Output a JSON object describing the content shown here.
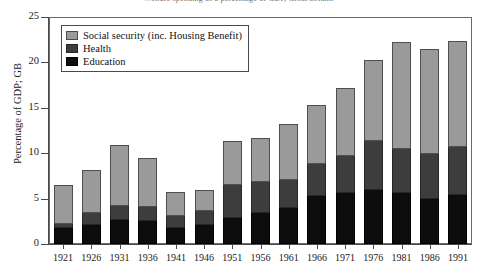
{
  "chart_data": {
    "type": "bar",
    "subtype": "stacked-vertical",
    "title": "Welfare spending as a percentage of GDP, Great Britain",
    "xlabel": "",
    "ylabel": "Percentage of GDP; GB",
    "ylim": [
      0,
      25
    ],
    "yticks": [
      0,
      5,
      10,
      15,
      20,
      25
    ],
    "ytick_labels": [
      "0",
      "5",
      "10",
      "15",
      "20",
      "25"
    ],
    "grid": false,
    "legend_position": "top-left",
    "categories": [
      "1921",
      "1926",
      "1931",
      "1936",
      "1941",
      "1946",
      "1951",
      "1956",
      "1961",
      "1966",
      "1971",
      "1976",
      "1981",
      "1986",
      "1991"
    ],
    "series": [
      {
        "name": "Education",
        "color": "#0d0d0d",
        "values": [
          1.8,
          2.1,
          2.6,
          2.5,
          1.8,
          2.1,
          2.9,
          3.4,
          4.0,
          5.3,
          5.6,
          5.9,
          5.6,
          5.0,
          5.4
        ]
      },
      {
        "name": "Health",
        "color": "#3d3d3d",
        "values": [
          0.4,
          1.3,
          1.6,
          1.6,
          1.3,
          1.5,
          3.6,
          3.4,
          3.1,
          3.5,
          4.1,
          5.4,
          4.9,
          4.9,
          5.3
        ]
      },
      {
        "name": "Social security (inc. Housing Benefit)",
        "color": "#9a9a9a",
        "values": [
          4.3,
          4.8,
          6.7,
          5.4,
          2.6,
          2.4,
          4.8,
          4.9,
          6.1,
          6.5,
          7.5,
          9.0,
          11.7,
          11.6,
          11.7
        ]
      }
    ],
    "totals": [
      6.5,
      8.2,
      10.9,
      9.5,
      5.7,
      6.0,
      11.3,
      11.7,
      13.2,
      15.3,
      17.2,
      20.3,
      22.2,
      21.5,
      22.4
    ]
  },
  "legend": {
    "items": [
      {
        "label": "Social security (inc. Housing Benefit)",
        "swatch": "social"
      },
      {
        "label": "Health",
        "swatch": "health"
      },
      {
        "label": "Education",
        "swatch": "education"
      }
    ]
  },
  "axes": {
    "y_title": "Percentage of GDP; GB"
  }
}
